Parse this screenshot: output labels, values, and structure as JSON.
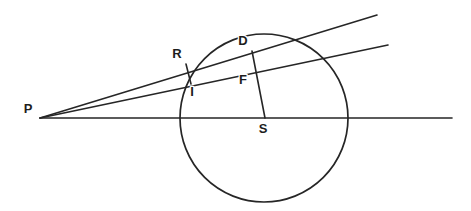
{
  "figure": {
    "canvas": {
      "width": 471,
      "height": 211
    },
    "background_color": "#ffffff",
    "stroke_color": "#262626",
    "label_color": "#1d1d1d"
  },
  "points": {
    "P": {
      "label": "P",
      "x": 40,
      "y": 118,
      "label_x": 28,
      "label_y": 110
    },
    "R": {
      "label": "R",
      "x": 186,
      "y": 64,
      "label_x": 177,
      "label_y": 55
    },
    "I": {
      "label": "I",
      "x": 190,
      "y": 82,
      "label_x": 192,
      "label_y": 93
    },
    "D": {
      "label": "D",
      "x": 252,
      "y": 51,
      "label_x": 243,
      "label_y": 42
    },
    "F": {
      "label": "F",
      "x": 253,
      "y": 72,
      "label_x": 243,
      "label_y": 81
    },
    "S": {
      "label": "S",
      "x": 265,
      "y": 118,
      "label_x": 263,
      "label_y": 130
    }
  },
  "circle": {
    "name": "main-circle",
    "center_x": 264,
    "center_y": 118,
    "radius": 84
  },
  "lines": [
    {
      "name": "upper-secant-ray",
      "from": "P",
      "x1": 40,
      "y1": 118,
      "x2": 377,
      "y2": 15
    },
    {
      "name": "lower-secant-ray",
      "from": "P",
      "x1": 40,
      "y1": 118,
      "x2": 388,
      "y2": 45
    },
    {
      "name": "horizontal-base-line",
      "from": "P",
      "x1": 40,
      "y1": 118,
      "x2": 452,
      "y2": 118
    }
  ],
  "segments": [
    {
      "name": "segment-R-I",
      "endpoints": "R-I",
      "x1": 186,
      "y1": 64,
      "x2": 191,
      "y2": 84
    },
    {
      "name": "segment-D-S",
      "endpoints": "D-S",
      "x1": 252,
      "y1": 51,
      "x2": 265,
      "y2": 118
    }
  ]
}
